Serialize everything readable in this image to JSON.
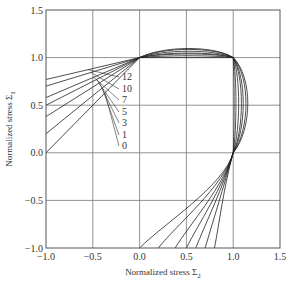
{
  "chart_data": {
    "type": "line",
    "title": "",
    "xlabel": "Normalized stress Σ2",
    "ylabel": "Normalized stress Σ1",
    "xlim": [
      -1.0,
      1.5
    ],
    "ylim": [
      -1.0,
      1.5
    ],
    "xticks": [
      "-1.0",
      "-0.5",
      "0.0",
      "0.5",
      "1.0",
      "1.5"
    ],
    "yticks": [
      "-1.0",
      "-0.5",
      "0.0",
      "0.5",
      "1.0",
      "1.5"
    ],
    "grid": true,
    "legend": "inline curve labels",
    "curve_labels": [
      "12",
      "10",
      "7",
      "5",
      "3",
      "1",
      "0"
    ],
    "series": [
      {
        "name": "12",
        "left_intercept_y_at_x_-1": 0.77,
        "bottom_intercept_x_at_y_-1": 0.8,
        "max_sigma1_bulge": 1.1,
        "max_sigma2_bulge": 1.16
      },
      {
        "name": "10",
        "left_intercept_y_at_x_-1": 0.7,
        "bottom_intercept_x_at_y_-1": 0.7,
        "max_sigma1_bulge": 1.09,
        "max_sigma2_bulge": 1.14
      },
      {
        "name": "7",
        "left_intercept_y_at_x_-1": 0.58,
        "bottom_intercept_x_at_y_-1": 0.6,
        "max_sigma1_bulge": 1.07,
        "max_sigma2_bulge": 1.11
      },
      {
        "name": "5",
        "left_intercept_y_at_x_-1": 0.5,
        "bottom_intercept_x_at_y_-1": 0.5,
        "max_sigma1_bulge": 1.05,
        "max_sigma2_bulge": 1.09
      },
      {
        "name": "3",
        "left_intercept_y_at_x_-1": 0.38,
        "bottom_intercept_x_at_y_-1": 0.38,
        "max_sigma1_bulge": 1.04,
        "max_sigma2_bulge": 1.06
      },
      {
        "name": "1",
        "left_intercept_y_at_x_-1": 0.2,
        "bottom_intercept_x_at_y_-1": 0.2,
        "max_sigma1_bulge": 1.02,
        "max_sigma2_bulge": 1.03
      },
      {
        "name": "0",
        "left_intercept_y_at_x_-1": 0.0,
        "bottom_intercept_x_at_y_-1": 0.0,
        "max_sigma1_bulge": 1.0,
        "max_sigma2_bulge": 1.01
      }
    ],
    "key_points": {
      "common_point_top": [
        0.0,
        1.0
      ],
      "common_point_corner": [
        1.0,
        1.0
      ],
      "common_point_right": [
        1.0,
        0.0
      ]
    }
  }
}
